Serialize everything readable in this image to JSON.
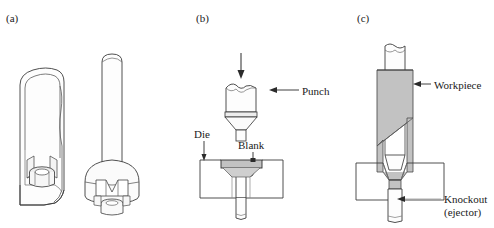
{
  "figure": {
    "background_color": "#ffffff",
    "line_color": "#3a3a3a",
    "fill_gray": "#c2c2c2",
    "fill_light": "#e8e8e8",
    "fill_white": "#ffffff"
  },
  "panels": [
    {
      "id": "a",
      "label": "(a)",
      "caption": "Finished parts: sectioned cup and flanged component",
      "objects": [
        {
          "name": "sectioned-cup",
          "description": "cutaway deep-drawn cup with internal boss and ribs"
        },
        {
          "name": "flanged-part",
          "description": "cylindrical shaft with flanged head and internal cavity"
        }
      ]
    },
    {
      "id": "b",
      "label": "(b)",
      "caption": "Punch approaching blank resting in die cavity",
      "objects": [
        {
          "name": "force-arrow",
          "description": "downward force arrow above punch"
        },
        {
          "name": "punch",
          "description": "punch with notched top, tapered nose and stem"
        },
        {
          "name": "die-block",
          "description": "rectangular die block with funnel cavity"
        },
        {
          "name": "blank",
          "description": "gray disc blank seated at top of die cavity"
        }
      ]
    },
    {
      "id": "c",
      "label": "(c)",
      "caption": "Punch bottomed out, metal extruded upward around punch forming workpiece",
      "objects": [
        {
          "name": "punch",
          "description": "punch inserted into die"
        },
        {
          "name": "workpiece",
          "description": "gray extruded wall of formed workpiece"
        },
        {
          "name": "die-block",
          "description": "rectangular die block"
        },
        {
          "name": "knockout-pin",
          "description": "ejector pin below die cavity"
        }
      ]
    }
  ],
  "labels": {
    "panel_a": "(a)",
    "panel_b": "(b)",
    "panel_c": "(c)",
    "punch": "Punch",
    "die": "Die",
    "blank": "Blank",
    "workpiece": "Workpiece",
    "knockout_line1": "Knockout",
    "knockout_line2": "(ejector)"
  }
}
